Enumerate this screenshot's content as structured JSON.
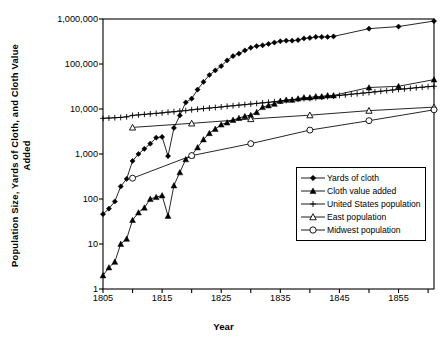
{
  "chart_data": {
    "type": "line",
    "title": "",
    "xlabel": "Year",
    "ylabel": "Population Size, Yards of Cloth, and Cloth Value Added",
    "yscale": "log",
    "ylim": [
      1,
      1000000
    ],
    "xlim": [
      1805,
      1861
    ],
    "grid": false,
    "legend_position": "inside-bottom-right",
    "ytick_labels": [
      "1,000,000",
      "100,000",
      "10,000",
      "1,000",
      "100",
      "10",
      "1"
    ],
    "ytick_values": [
      1000000,
      100000,
      10000,
      1000,
      100,
      10,
      1
    ],
    "xtick_labels": [
      "1805",
      "1815",
      "1825",
      "1835",
      "1845",
      "1855"
    ],
    "xtick_values": [
      1805,
      1815,
      1825,
      1835,
      1845,
      1855
    ],
    "xminor_values": [
      1810,
      1820,
      1830,
      1840,
      1850,
      1860
    ],
    "series": [
      {
        "name": "Yards of cloth",
        "marker": "filled-diamond",
        "x": [
          1805,
          1806,
          1807,
          1808,
          1809,
          1810,
          1811,
          1812,
          1813,
          1814,
          1815,
          1816,
          1817,
          1818,
          1819,
          1820,
          1821,
          1822,
          1823,
          1824,
          1825,
          1826,
          1827,
          1828,
          1829,
          1830,
          1831,
          1832,
          1833,
          1834,
          1835,
          1836,
          1837,
          1838,
          1839,
          1840,
          1841,
          1842,
          1843,
          1844,
          1850,
          1855,
          1861
        ],
        "y": [
          46,
          61,
          88,
          190,
          280,
          700,
          1000,
          1300,
          1700,
          2300,
          2400,
          900,
          3800,
          7200,
          14000,
          17000,
          27000,
          40000,
          57000,
          72000,
          90000,
          120000,
          150000,
          170000,
          200000,
          230000,
          250000,
          260000,
          280000,
          300000,
          320000,
          330000,
          330000,
          340000,
          370000,
          380000,
          400000,
          400000,
          400000,
          410000,
          610000,
          680000,
          900000
        ]
      },
      {
        "name": "Cloth value added",
        "marker": "filled-triangle",
        "x": [
          1805,
          1806,
          1807,
          1808,
          1809,
          1810,
          1811,
          1812,
          1813,
          1814,
          1815,
          1816,
          1817,
          1818,
          1819,
          1820,
          1821,
          1822,
          1823,
          1824,
          1825,
          1826,
          1827,
          1828,
          1829,
          1830,
          1831,
          1832,
          1833,
          1834,
          1835,
          1836,
          1837,
          1838,
          1839,
          1840,
          1841,
          1842,
          1843,
          1844,
          1850,
          1855,
          1861
        ],
        "y": [
          2,
          3,
          4,
          10,
          13,
          34,
          50,
          64,
          100,
          110,
          120,
          42,
          200,
          390,
          760,
          930,
          1400,
          2100,
          2900,
          3600,
          4500,
          5000,
          5700,
          6300,
          6900,
          7300,
          8500,
          11000,
          12000,
          13000,
          15000,
          16000,
          16000,
          17000,
          18000,
          18000,
          19000,
          19000,
          20000,
          20000,
          30000,
          32000,
          45000
        ]
      },
      {
        "name": "United States population",
        "marker": "plus",
        "x": [
          1805,
          1806,
          1807,
          1808,
          1809,
          1810,
          1811,
          1812,
          1813,
          1814,
          1815,
          1816,
          1817,
          1818,
          1819,
          1820,
          1821,
          1822,
          1823,
          1824,
          1825,
          1826,
          1827,
          1828,
          1829,
          1830,
          1831,
          1832,
          1833,
          1834,
          1835,
          1836,
          1837,
          1838,
          1839,
          1840,
          1841,
          1842,
          1843,
          1844,
          1845,
          1846,
          1847,
          1848,
          1849,
          1850,
          1851,
          1852,
          1853,
          1854,
          1855,
          1856,
          1857,
          1858,
          1859,
          1860,
          1861
        ],
        "y": [
          6200,
          6300,
          6400,
          6500,
          6700,
          7200,
          7400,
          7600,
          7800,
          8000,
          8200,
          8500,
          8700,
          9000,
          9200,
          9600,
          9900,
          10200,
          10500,
          10800,
          11100,
          11500,
          11800,
          12200,
          12500,
          12900,
          13300,
          13700,
          14100,
          14500,
          15000,
          15500,
          16000,
          16500,
          17000,
          17100,
          17700,
          18300,
          18800,
          19400,
          20000,
          20600,
          21300,
          21900,
          22600,
          23200,
          24000,
          24800,
          25600,
          26400,
          27200,
          28000,
          28800,
          29700,
          30500,
          31400,
          32000
        ]
      },
      {
        "name": "East population",
        "marker": "open-triangle",
        "x": [
          1810,
          1820,
          1830,
          1840,
          1850,
          1861
        ],
        "y": [
          3900,
          4800,
          6000,
          7300,
          9200,
          11000
        ]
      },
      {
        "name": "Midwest population",
        "marker": "open-circle",
        "x": [
          1810,
          1820,
          1830,
          1840,
          1850,
          1861
        ],
        "y": [
          290,
          920,
          1700,
          3400,
          5500,
          9600
        ]
      }
    ]
  },
  "axes": {
    "ylabel_line1": "Population Size, Yards of Cloth, and Cloth Value",
    "ylabel_line2": "Added",
    "xlabel": "Year"
  },
  "legend": {
    "items": [
      {
        "label": "Yards of cloth",
        "marker": "filled-diamond"
      },
      {
        "label": "Cloth value added",
        "marker": "filled-triangle"
      },
      {
        "label": "United States population",
        "marker": "plus"
      },
      {
        "label": "East population",
        "marker": "open-triangle"
      },
      {
        "label": "Midwest population",
        "marker": "open-circle"
      }
    ]
  },
  "colors": {
    "line": "#000000",
    "axis": "#000000",
    "background": "#ffffff"
  }
}
